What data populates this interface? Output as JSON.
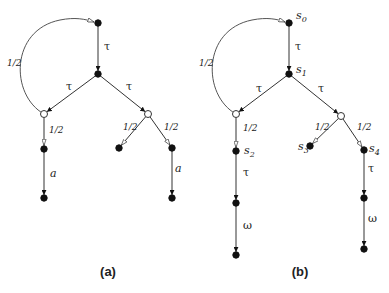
{
  "figure": {
    "diagrams": [
      {
        "id": "a",
        "caption": "(a)",
        "caption_pos": [
          108,
          276
        ],
        "nodes": [
          {
            "id": "a_root",
            "x": 98,
            "y": 23,
            "type": "filled",
            "label": ""
          },
          {
            "id": "a_n1",
            "x": 98,
            "y": 74,
            "type": "filled",
            "label": ""
          },
          {
            "id": "a_pl",
            "x": 44,
            "y": 114,
            "type": "open",
            "label": ""
          },
          {
            "id": "a_pr",
            "x": 148,
            "y": 114,
            "type": "open",
            "label": ""
          },
          {
            "id": "a_l1",
            "x": 44,
            "y": 149,
            "type": "filled",
            "label": ""
          },
          {
            "id": "a_l2",
            "x": 44,
            "y": 198,
            "type": "filled",
            "label": ""
          },
          {
            "id": "a_r1",
            "x": 119,
            "y": 148,
            "type": "filled",
            "label": ""
          },
          {
            "id": "a_r2",
            "x": 172,
            "y": 148,
            "type": "filled",
            "label": ""
          },
          {
            "id": "a_r3",
            "x": 172,
            "y": 198,
            "type": "filled",
            "label": ""
          }
        ],
        "edges": [
          {
            "from": "a_root",
            "to": "a_n1",
            "label": "τ",
            "lx": 104,
            "ly": 50,
            "kind": "action"
          },
          {
            "from": "a_n1",
            "to": "a_pl",
            "label": "τ",
            "lx": 66,
            "ly": 90,
            "kind": "action"
          },
          {
            "from": "a_n1",
            "to": "a_pr",
            "label": "τ",
            "lx": 126,
            "ly": 90,
            "kind": "action"
          },
          {
            "from": "a_pl",
            "to": "a_l1",
            "label": "1/2",
            "lx": 49,
            "ly": 133,
            "kind": "prob"
          },
          {
            "from": "a_l1",
            "to": "a_l2",
            "label": "a",
            "lx": 50,
            "ly": 177,
            "kind": "action-it"
          },
          {
            "from": "a_pr",
            "to": "a_r1",
            "label": "1/2",
            "lx": 123,
            "ly": 130,
            "kind": "prob"
          },
          {
            "from": "a_pr",
            "to": "a_r2",
            "label": "1/2",
            "lx": 164,
            "ly": 130,
            "kind": "prob"
          },
          {
            "from": "a_r2",
            "to": "a_r3",
            "label": "a",
            "lx": 175,
            "ly": 172,
            "kind": "action-it"
          }
        ],
        "loop": {
          "from": "a_pl",
          "to": "a_root",
          "label": "1/2",
          "lx": 7,
          "ly": 66,
          "path": "M44,114 C10,95 10,30 60,20 C75,17 85,19 94,22"
        }
      },
      {
        "id": "b",
        "caption": "(b)",
        "caption_pos": [
          300,
          276
        ],
        "nodes": [
          {
            "id": "b_root",
            "x": 289,
            "y": 23,
            "type": "filled",
            "label": "s",
            "sub": "0",
            "lx": 296,
            "ly": 19
          },
          {
            "id": "b_n1",
            "x": 289,
            "y": 74,
            "type": "filled",
            "label": "s",
            "sub": "1",
            "lx": 296,
            "ly": 73
          },
          {
            "id": "b_pl",
            "x": 236,
            "y": 114,
            "type": "open",
            "label": ""
          },
          {
            "id": "b_pr",
            "x": 341,
            "y": 116,
            "type": "open",
            "label": ""
          },
          {
            "id": "b_s2",
            "x": 236,
            "y": 151,
            "type": "filled",
            "label": "s",
            "sub": "2",
            "lx": 244,
            "ly": 154
          },
          {
            "id": "b_l2",
            "x": 236,
            "y": 203,
            "type": "filled",
            "label": ""
          },
          {
            "id": "b_l3",
            "x": 236,
            "y": 255,
            "type": "filled",
            "label": ""
          },
          {
            "id": "b_s3",
            "x": 310,
            "y": 146,
            "type": "filled",
            "label": "s",
            "sub": "3",
            "lx": 298,
            "ly": 150
          },
          {
            "id": "b_s4",
            "x": 364,
            "y": 150,
            "type": "filled",
            "label": "s",
            "sub": "4",
            "lx": 369,
            "ly": 152
          },
          {
            "id": "b_r2",
            "x": 364,
            "y": 198,
            "type": "filled",
            "label": ""
          },
          {
            "id": "b_r3",
            "x": 364,
            "y": 249,
            "type": "filled",
            "label": ""
          }
        ],
        "edges": [
          {
            "from": "b_root",
            "to": "b_n1",
            "label": "τ",
            "lx": 295,
            "ly": 50,
            "kind": "action"
          },
          {
            "from": "b_n1",
            "to": "b_pl",
            "label": "τ",
            "lx": 256,
            "ly": 92,
            "kind": "action"
          },
          {
            "from": "b_n1",
            "to": "b_pr",
            "label": "τ",
            "lx": 318,
            "ly": 92,
            "kind": "action"
          },
          {
            "from": "b_pl",
            "to": "b_s2",
            "label": "1/2",
            "lx": 243,
            "ly": 131,
            "kind": "prob"
          },
          {
            "from": "b_s2",
            "to": "b_l2",
            "label": "τ",
            "lx": 243,
            "ly": 176,
            "kind": "action"
          },
          {
            "from": "b_l2",
            "to": "b_l3",
            "label": "ω",
            "lx": 243,
            "ly": 229,
            "kind": "action"
          },
          {
            "from": "b_pr",
            "to": "b_s3",
            "label": "1/2",
            "lx": 315,
            "ly": 130,
            "kind": "prob"
          },
          {
            "from": "b_pr",
            "to": "b_s4",
            "label": "1/2",
            "lx": 357,
            "ly": 130,
            "kind": "prob"
          },
          {
            "from": "b_s4",
            "to": "b_r2",
            "label": "τ",
            "lx": 368,
            "ly": 172,
            "kind": "action"
          },
          {
            "from": "b_r2",
            "to": "b_r3",
            "label": "ω",
            "lx": 368,
            "ly": 222,
            "kind": "action"
          }
        ],
        "loop": {
          "from": "b_pl",
          "to": "b_root",
          "label": "1/2",
          "lx": 199,
          "ly": 66,
          "path": "M236,114 C202,95 202,30 252,20 C267,17 277,19 285,22"
        }
      }
    ]
  }
}
